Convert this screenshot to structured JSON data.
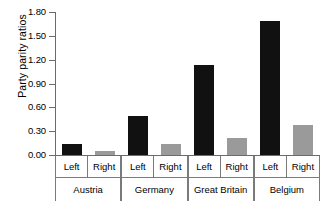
{
  "chart_data": {
    "type": "bar",
    "title": "",
    "xlabel": "",
    "ylabel": "Party parity ratios",
    "ylim": [
      0.0,
      1.8
    ],
    "yticks": [
      "0.00",
      "0.30",
      "0.60",
      "0.90",
      "1.20",
      "1.50",
      "1.80"
    ],
    "ytick_values": [
      0.0,
      0.3,
      0.6,
      0.9,
      1.2,
      1.5,
      1.8
    ],
    "grid": false,
    "legend": null,
    "categories": [
      "Austria",
      "Germany",
      "Great Britain",
      "Belgium"
    ],
    "subcategories": [
      "Left",
      "Right"
    ],
    "series": [
      {
        "name": "Left",
        "color": "#111111",
        "values": [
          0.14,
          0.49,
          1.13,
          1.69
        ]
      },
      {
        "name": "Right",
        "color": "#9a9a9a",
        "values": [
          0.05,
          0.14,
          0.22,
          0.38
        ]
      }
    ],
    "groups": [
      {
        "label": "Austria",
        "bars": [
          {
            "label": "Left",
            "value": 0.14,
            "color": "#111111"
          },
          {
            "label": "Right",
            "value": 0.05,
            "color": "#9a9a9a"
          }
        ]
      },
      {
        "label": "Germany",
        "bars": [
          {
            "label": "Left",
            "value": 0.49,
            "color": "#111111"
          },
          {
            "label": "Right",
            "value": 0.14,
            "color": "#9a9a9a"
          }
        ]
      },
      {
        "label": "Great Britain",
        "bars": [
          {
            "label": "Left",
            "value": 1.13,
            "color": "#111111"
          },
          {
            "label": "Right",
            "value": 0.22,
            "color": "#9a9a9a"
          }
        ]
      },
      {
        "label": "Belgium",
        "bars": [
          {
            "label": "Left",
            "value": 1.69,
            "color": "#111111"
          },
          {
            "label": "Right",
            "value": 0.38,
            "color": "#9a9a9a"
          }
        ]
      }
    ]
  },
  "axis": {
    "y_title": "Party parity ratios",
    "tick_0": "0.00",
    "tick_1": "0.30",
    "tick_2": "0.60",
    "tick_3": "0.90",
    "tick_4": "1.20",
    "tick_5": "1.50",
    "tick_6": "1.80"
  },
  "colors": {
    "left_bar": "#111111",
    "right_bar": "#9a9a9a",
    "axis_line": "#6b6b6b",
    "text": "#000000",
    "background": "#ffffff"
  }
}
